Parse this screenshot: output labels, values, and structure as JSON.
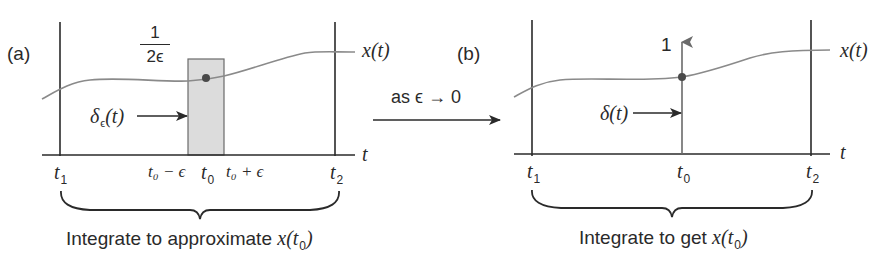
{
  "panel_a": {
    "label": "(a)",
    "curve_label": "x(t)",
    "axis_label": "t",
    "height_fraction": {
      "numerator": "1",
      "denominator": "2ϵ"
    },
    "pulse_label": "δϵ(t)",
    "pulse_label_main": "δ",
    "pulse_label_sub": "ϵ",
    "pulse_label_arg": "(t)",
    "ticks": {
      "t1": {
        "main": "t",
        "sub": "1"
      },
      "t0_minus": "t₀ − ϵ",
      "t0": {
        "main": "t",
        "sub": "0"
      },
      "t0_plus": "t₀ + ϵ",
      "t2": {
        "main": "t",
        "sub": "2"
      }
    },
    "caption": "Integrate to approximate x(t₀)",
    "caption_text": "Integrate to approximate ",
    "caption_math_main": "x(t",
    "caption_math_sub": "0",
    "caption_math_close": ")"
  },
  "transition": {
    "label": "as ϵ → 0"
  },
  "panel_b": {
    "label": "(b)",
    "curve_label": "x(t)",
    "axis_label": "t",
    "impulse_height": "1",
    "impulse_label": "δ(t)",
    "ticks": {
      "t1": {
        "main": "t",
        "sub": "1"
      },
      "t0": {
        "main": "t",
        "sub": "0"
      },
      "t2": {
        "main": "t",
        "sub": "2"
      }
    },
    "caption": "Integrate to get x(t₀)",
    "caption_text": "Integrate to get ",
    "caption_math_main": "x(t",
    "caption_math_sub": "0",
    "caption_math_close": ")"
  },
  "colors": {
    "ink": "#2a2a2a",
    "curve": "#8a8a8a",
    "pulse_fill": "#dcdcdc",
    "pulse_edge": "#6a6a6a",
    "dot": "#4a4a4a"
  }
}
